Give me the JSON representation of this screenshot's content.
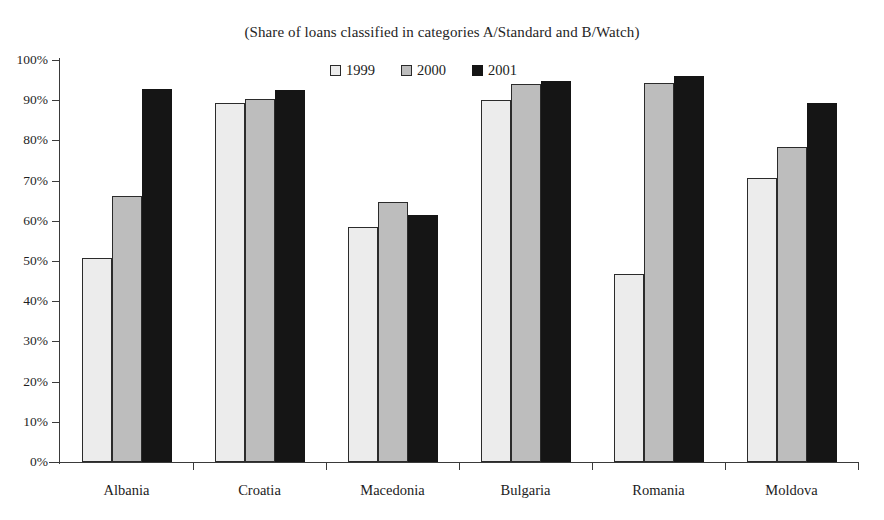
{
  "chart_data": {
    "type": "bar",
    "title": "(Share of loans classified in categories A/Standard and B/Watch)",
    "xlabel": "",
    "ylabel": "",
    "ylim": [
      0,
      100
    ],
    "grid": false,
    "legend_position": "top-center",
    "categories": [
      "Albania",
      "Croatia",
      "Macedonia",
      "Bulgaria",
      "Romania",
      "Moldova"
    ],
    "tick_labels": [
      "100%",
      "90%",
      "80%",
      "70%",
      "60%",
      "50%",
      "40%",
      "30%",
      "20%",
      "10%",
      "0%"
    ],
    "tick_values": [
      100,
      90,
      80,
      70,
      60,
      50,
      40,
      30,
      20,
      10,
      0
    ],
    "series": [
      {
        "name": "1999",
        "color": "#ececec",
        "values": [
          50.8,
          89.4,
          58.4,
          90.1,
          46.8,
          70.7
        ]
      },
      {
        "name": "2000",
        "color": "#bdbdbd",
        "values": [
          66.1,
          90.3,
          64.7,
          94.1,
          94.2,
          78.4
        ]
      },
      {
        "name": "2001",
        "color": "#151515",
        "values": [
          92.8,
          92.6,
          61.4,
          94.7,
          95.9,
          89.3
        ]
      }
    ]
  }
}
